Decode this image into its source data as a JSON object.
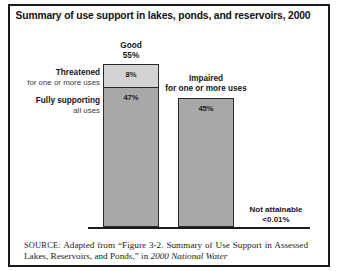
{
  "figure": {
    "title": "Summary of use support in lakes, ponds, and reservoirs, 2000"
  },
  "labels": {
    "good_name": "Good",
    "good_value": "55%",
    "threatened_name": "Threatened",
    "threatened_sub": "for one or more uses",
    "fully_name": "Fully supporting",
    "fully_sub": "all uses",
    "impaired_name": "Impaired",
    "impaired_sub": "for one or more uses",
    "notattainable_name": "Not attainable",
    "notattainable_value": "<0.01%"
  },
  "bar_values": {
    "threatened": "8%",
    "fully_supporting": "47%",
    "impaired": "45%"
  },
  "source": {
    "prefix": "SOURCE:",
    "body": " Adapted from “Figure 3-2. Summary of Use Support in Assessed Lakes, Reservoirs, and Ponds,” in ",
    "italic": "2000 National Water"
  },
  "colors": {
    "threatened_fill": "#d3d3d3",
    "fully_fill": "#a8a8a8",
    "impaired_fill": "#a8a8a8",
    "frame": "#1a1a1a",
    "axis": "#1b1b1b"
  },
  "chart_data": {
    "type": "bar",
    "title": "Summary of use support in lakes, ponds, and reservoirs, 2000",
    "xlabel": "",
    "ylabel": "",
    "ylim": [
      0,
      55
    ],
    "grid": false,
    "legend": "none",
    "stacked": true,
    "categories": [
      "Good",
      "Impaired"
    ],
    "series": [
      {
        "name": "Fully supporting all uses",
        "values": [
          47,
          null
        ]
      },
      {
        "name": "Threatened for one or more uses",
        "values": [
          8,
          null
        ]
      },
      {
        "name": "Impaired for one or more uses",
        "values": [
          null,
          45
        ]
      }
    ],
    "annotations": [
      {
        "text": "Good 55%",
        "value": 55,
        "category": "Good"
      },
      {
        "text": "Threatened for one or more uses 8%",
        "value": 8,
        "category": "Good"
      },
      {
        "text": "Fully supporting all uses 47%",
        "value": 47,
        "category": "Good"
      },
      {
        "text": "Impaired for one or more uses 45%",
        "value": 45,
        "category": "Impaired"
      },
      {
        "text": "Not attainable <0.01%",
        "value": 0.01,
        "category": "Not attainable"
      }
    ],
    "units": "percent of assessed lake, pond, and reservoir acres"
  }
}
